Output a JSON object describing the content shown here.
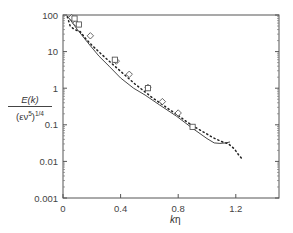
{
  "chart_data": {
    "type": "line",
    "title": "",
    "xlabel": "kη",
    "ylabel": "E(k) / (εν^5)^(1/4)",
    "ylabel_parts": {
      "numerator": "E(k)",
      "denominator_base": "(εν",
      "denominator_sup": "5",
      "denominator_close": ")",
      "denominator_exp": "1/4"
    },
    "xlim": [
      0,
      1.5
    ],
    "ylim": [
      0.001,
      100
    ],
    "yscale": "log",
    "xticks": [
      0,
      0.4,
      0.8,
      1.2
    ],
    "xtick_labels": [
      "0",
      "0.4",
      "0.8",
      "1.2"
    ],
    "yticks": [
      100,
      10,
      1,
      0.1,
      0.01,
      0.001
    ],
    "ytick_labels": [
      "100",
      "10",
      "1",
      "0.1",
      "0.01",
      "0.001"
    ],
    "grid": false,
    "legend": null,
    "series": [
      {
        "name": "solid-line",
        "style": "solid",
        "x": [
          0.03,
          0.1,
          0.17,
          0.25,
          0.32,
          0.4,
          0.49,
          0.57,
          0.67,
          0.79,
          0.9,
          1.0,
          1.05,
          1.09,
          1.13,
          1.16
        ],
        "y": [
          95,
          40,
          18,
          7.5,
          4.0,
          1.9,
          1.0,
          0.65,
          0.35,
          0.17,
          0.08,
          0.042,
          0.032,
          0.031,
          0.032,
          0.034
        ]
      },
      {
        "name": "dotted-line",
        "style": "dotted",
        "x": [
          0.03,
          0.05,
          0.08,
          0.12,
          0.16,
          0.2,
          0.26,
          0.32,
          0.38,
          0.44,
          0.5,
          0.56,
          0.62,
          0.68,
          0.74,
          0.8,
          0.86,
          0.92,
          0.98,
          1.04,
          1.1,
          1.15,
          1.19,
          1.22,
          1.25
        ],
        "y": [
          90,
          50,
          40,
          35,
          22,
          15,
          9,
          5.5,
          3.4,
          2.1,
          1.3,
          0.85,
          0.55,
          0.38,
          0.26,
          0.18,
          0.12,
          0.085,
          0.062,
          0.045,
          0.035,
          0.03,
          0.022,
          0.015,
          0.011
        ]
      },
      {
        "name": "diamond-markers",
        "style": "marker-diamond",
        "x": [
          0.06,
          0.09,
          0.19,
          0.37,
          0.46,
          0.59,
          0.69,
          0.8
        ],
        "y": [
          85,
          60,
          27,
          5.5,
          2.4,
          1.05,
          0.43,
          0.21
        ]
      },
      {
        "name": "square-markers",
        "style": "marker-square",
        "x": [
          0.08,
          0.11,
          0.36,
          0.59,
          0.9
        ],
        "y": [
          80,
          55,
          6.0,
          1.0,
          0.088
        ]
      }
    ]
  },
  "axes": {
    "x_title_italic": "k",
    "x_title_rest": "η"
  }
}
